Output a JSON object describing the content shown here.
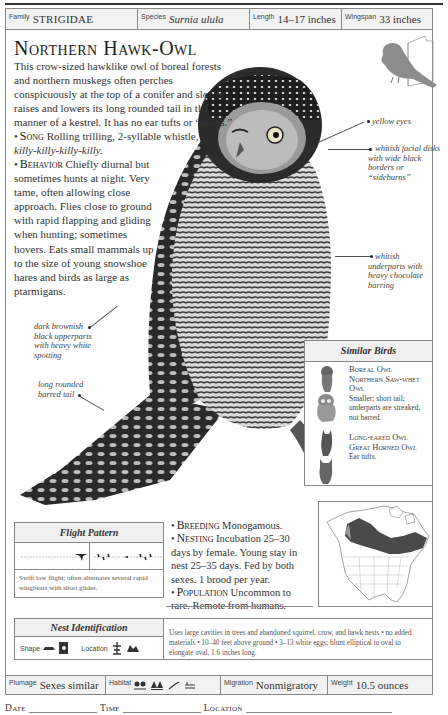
{
  "header": {
    "family_label": "Family",
    "family_value": "STRIGIDAE",
    "species_label": "Species",
    "species_value": "Surnia ulula",
    "length_label": "Length",
    "length_value": "14–17 inches",
    "wingspan_label": "Wingspan",
    "wingspan_value": "33 inches"
  },
  "title": "Northern Hawk-Owl",
  "intro": "This crow-sized hawklike owl of boreal forests and northern muskegs often perches conspicuously at the top of a conifer and slowly raises and lowers its long rounded tail in the manner of a kestrel. It has no ear tufts or “horns.”",
  "song": {
    "heading": "Song",
    "text": "Rolling trilling, 2-syllable whistle,",
    "call": "killy-killy-killy-killy."
  },
  "behavior": {
    "heading": "Behavior",
    "text": "Chiefly diurnal but sometimes hunts at night. Very tame, often allowing close approach. Flies close to ground with rapid flapping and gliding when hunting; sometimes hovers. Eats small mammals up to the size of young snowshoe hares and birds as large as ptarmigans."
  },
  "annotations": {
    "yellow_eyes": "yellow eyes",
    "facial_disks": "whitish facial disks with wide black borders or “sideburns”",
    "underparts": "whitish underparts with heavy chocolate barring",
    "upperparts": "dark brownish black upperparts with heavy white spotting",
    "tail": "long rounded barred tail"
  },
  "similar_birds": {
    "heading": "Similar Birds",
    "groups": [
      {
        "names": "Boreal Owl",
        "names2": "Northern Saw-whet Owl",
        "desc": "Smaller; short tail; underparts are streaked, not barred."
      },
      {
        "names": "Long-eared Owl",
        "names2": "Great Horned Owl",
        "desc": "Ear tufts."
      }
    ]
  },
  "flight": {
    "heading": "Flight Pattern",
    "description": "Swift low flight; often alternates several rapid wingbeats with short glides."
  },
  "breeding": {
    "heading": "Breeding",
    "text": "Monogamous."
  },
  "nesting": {
    "heading": "Nesting",
    "text": "Incubation 25–30 days by female. Young stay in nest 25–35 days. Fed by both sexes. 1 brood per year."
  },
  "population": {
    "heading": "Population",
    "text": "Uncommon to rare. Remote from humans."
  },
  "nest_id": {
    "heading": "Nest Identification",
    "shape_label": "Shape",
    "location_label": "Location",
    "description": "Uses large cavities in trees and abandoned squirrel, crow, and hawk nests • no added materials • 10–40 feet above ground • 3–13 white eggs; blunt elliptical to oval to elongate oval, 1.6 inches long."
  },
  "footer": {
    "plumage_label": "Plumage",
    "plumage_value": "Sexes similar",
    "habitat_label": "Habitat",
    "habitat_icons": [
      "forest-edge-icon",
      "conifer-forest-icon",
      "bird-perch-icon",
      "marsh-icon"
    ],
    "migration_label": "Migration",
    "migration_value": "Nonmigratory",
    "weight_label": "Weight",
    "weight_value": "10.5 ounces"
  },
  "log": {
    "date_label": "Date",
    "time_label": "Time",
    "location_label": "Location"
  },
  "colors": {
    "range_fill": "#4a4a4a",
    "bookmark_bird": "#8c8c8c",
    "rule": "#888888",
    "header_bg": "#f2f2f2"
  }
}
